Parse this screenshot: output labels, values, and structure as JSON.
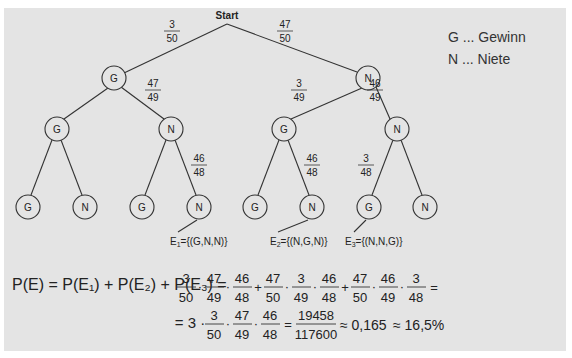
{
  "tree": {
    "root_label": "Start",
    "level1": {
      "nodes": [
        "G",
        "N"
      ],
      "edge_probs": [
        {
          "num": "3",
          "den": "50"
        },
        {
          "num": "47",
          "den": "50"
        }
      ]
    },
    "level2": {
      "nodes": [
        "G",
        "N",
        "G",
        "N"
      ],
      "edge_probs": [
        {
          "num": "",
          "den": ""
        },
        {
          "num": "47",
          "den": "49"
        },
        {
          "num": "3",
          "den": "49"
        },
        {
          "num": "46",
          "den": "49"
        }
      ]
    },
    "level3": {
      "nodes": [
        "G",
        "N",
        "G",
        "N",
        "G",
        "N",
        "G",
        "N"
      ],
      "edge_probs": [
        {
          "num": "",
          "den": ""
        },
        {
          "num": "",
          "den": ""
        },
        {
          "num": "",
          "den": ""
        },
        {
          "num": "46",
          "den": "48"
        },
        {
          "num": "",
          "den": ""
        },
        {
          "num": "46",
          "den": "48"
        },
        {
          "num": "3",
          "den": "48"
        },
        {
          "num": "",
          "den": ""
        }
      ]
    },
    "events": [
      {
        "label": "E",
        "sub": "1",
        "set": "={(G,N,N)}"
      },
      {
        "label": "E",
        "sub": "2",
        "set": "={(N,G,N)}"
      },
      {
        "label": "E",
        "sub": "3",
        "set": "={(N,N,G)}"
      }
    ]
  },
  "legend": {
    "g": "G ... Gewinn",
    "n": "N ... Niete"
  },
  "formula": {
    "line1_lhs": "P(E) = P(E₁) + P(E₂) + P(E₃) =",
    "terms": [
      [
        [
          "3",
          "50"
        ],
        [
          "47",
          "49"
        ],
        [
          "46",
          "48"
        ]
      ],
      [
        [
          "47",
          "50"
        ],
        [
          "3",
          "49"
        ],
        [
          "46",
          "48"
        ]
      ],
      [
        [
          "47",
          "50"
        ],
        [
          "46",
          "49"
        ],
        [
          "3",
          "48"
        ]
      ]
    ],
    "line2_prefix": "= 3 ·",
    "line2_factors": [
      [
        "3",
        "50"
      ],
      [
        "47",
        "49"
      ],
      [
        "46",
        "48"
      ]
    ],
    "result_fraction": [
      "19458",
      "117600"
    ],
    "approx_decimal": "≈ 0,165",
    "approx_percent": "≈ 16,5%"
  }
}
